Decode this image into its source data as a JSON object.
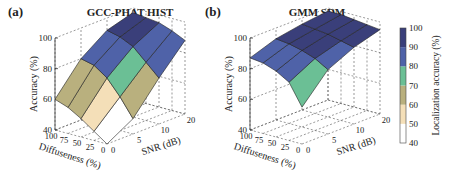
{
  "colorbar": {
    "label": "Localization accuracy (%)",
    "ticks": [
      "100",
      "90",
      "80",
      "70",
      "60",
      "50",
      "40"
    ],
    "range": [
      40,
      100
    ],
    "colors": [
      {
        "from": 40,
        "to": 50,
        "hex": "#ffffff"
      },
      {
        "from": 50,
        "to": 60,
        "hex": "#f4dfb8"
      },
      {
        "from": 60,
        "to": 70,
        "hex": "#b9b07e"
      },
      {
        "from": 70,
        "to": 80,
        "hex": "#6bbf95"
      },
      {
        "from": 80,
        "to": 90,
        "hex": "#4f62a8"
      },
      {
        "from": 90,
        "to": 100,
        "hex": "#3a3f7a"
      }
    ]
  },
  "chart_data": [
    {
      "panel_label": "(a)",
      "type": "surface",
      "title": "GCC-PHAT HIST",
      "xlabel": "Diffuseness (%)",
      "ylabel": "SNR (dB)",
      "zlabel": "Accuracy (%)",
      "x_ticks": [
        "100",
        "75",
        "50",
        "25",
        "0"
      ],
      "y_ticks": [
        "0",
        "5",
        "10",
        "20"
      ],
      "z_ticks": [
        "40",
        "60",
        "80",
        "100"
      ],
      "zlim": [
        40,
        100
      ],
      "diffuseness": [
        100,
        75,
        50,
        25,
        0
      ],
      "snr": [
        0,
        5,
        10,
        20
      ],
      "z": [
        [
          60,
          80,
          92,
          97
        ],
        [
          57,
          78,
          90,
          96
        ],
        [
          52,
          72,
          86,
          95
        ],
        [
          46,
          62,
          78,
          92
        ],
        [
          40,
          50,
          70,
          88
        ]
      ]
    },
    {
      "panel_label": "(b)",
      "type": "surface",
      "title": "GMM SDM",
      "xlabel": "Diffuseness (%)",
      "ylabel": "SNR (dB)",
      "zlabel": "Accuracy (%)",
      "x_ticks": [
        "100",
        "75",
        "50",
        "25",
        "0"
      ],
      "y_ticks": [
        "0",
        "5",
        "10",
        "20"
      ],
      "z_ticks": [
        "40",
        "60",
        "80",
        "100"
      ],
      "zlim": [
        40,
        100
      ],
      "diffuseness": [
        100,
        75,
        50,
        25,
        0
      ],
      "snr": [
        0,
        5,
        10,
        20
      ],
      "z": [
        [
          87,
          93,
          96,
          98
        ],
        [
          86,
          92,
          95,
          98
        ],
        [
          83,
          90,
          94,
          97
        ],
        [
          78,
          87,
          92,
          96
        ],
        [
          64,
          82,
          90,
          95
        ]
      ]
    }
  ]
}
